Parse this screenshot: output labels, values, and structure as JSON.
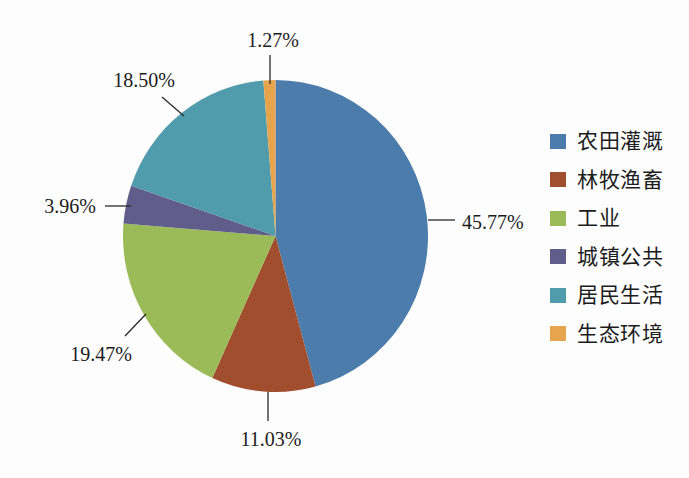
{
  "chart_data": {
    "type": "pie",
    "title": "",
    "legend_position": "right",
    "start_angle_deg": -90,
    "direction": "clockwise",
    "unit": "%",
    "slices": [
      {
        "label": "农田灌溉",
        "value": 45.77,
        "percent_label": "45.77%",
        "color": "#4B7CAB"
      },
      {
        "label": "林牧渔畜",
        "value": 11.03,
        "percent_label": "11.03%",
        "color": "#A04E2D"
      },
      {
        "label": "工业",
        "value": 19.47,
        "percent_label": "19.47%",
        "color": "#9ABB57"
      },
      {
        "label": "城镇公共",
        "value": 3.96,
        "percent_label": "3.96%",
        "color": "#615D8B"
      },
      {
        "label": "居民生活",
        "value": 18.5,
        "percent_label": "18.50%",
        "color": "#509BAC"
      },
      {
        "label": "生态环境",
        "value": 1.27,
        "percent_label": "1.27%",
        "color": "#E6A44C"
      }
    ],
    "leader_line_color": "#2a2a2a"
  }
}
